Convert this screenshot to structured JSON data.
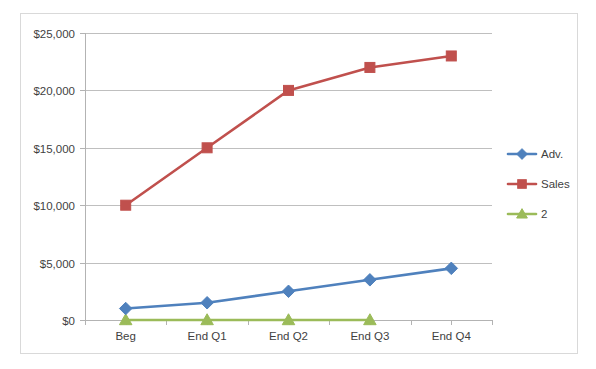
{
  "chart_data": {
    "type": "line",
    "title": "",
    "subtitle": "",
    "xlabel": "",
    "ylabel": "",
    "categories": [
      "Beg",
      "End Q1",
      "End Q2",
      "End Q3",
      "End Q4"
    ],
    "ylim": [
      0,
      25000
    ],
    "yticks": [
      0,
      5000,
      10000,
      15000,
      20000,
      25000
    ],
    "ytick_labels": [
      "$0",
      "$5,000",
      "$10,000",
      "$15,000",
      "$20,000",
      "$25,000"
    ],
    "grid": "horizontal",
    "legend_position": "right",
    "series": [
      {
        "name": "Adv.",
        "color": "#4f81bd",
        "marker": "diamond",
        "values": [
          1000,
          1500,
          2500,
          3500,
          4500
        ]
      },
      {
        "name": "Sales",
        "color": "#c0504d",
        "marker": "square",
        "values": [
          10000,
          15000,
          20000,
          22000,
          23000
        ]
      },
      {
        "name": "2",
        "color": "#9bbb59",
        "marker": "triangle",
        "values": [
          0,
          0,
          0,
          0,
          null
        ]
      }
    ]
  },
  "legend": {
    "entries": [
      {
        "label": "Adv.",
        "color": "#4f81bd",
        "marker": "diamond"
      },
      {
        "label": "Sales",
        "color": "#c0504d",
        "marker": "square"
      },
      {
        "label": "2",
        "color": "#9bbb59",
        "marker": "triangle"
      }
    ]
  },
  "colors": {
    "adv": "#4f81bd",
    "sales": "#c0504d",
    "series2": "#9bbb59",
    "gridline": "#bfbfbf",
    "axis": "#b3b3b3",
    "border": "#d9d9d9",
    "text": "#3f3f3f",
    "background": "#ffffff"
  }
}
